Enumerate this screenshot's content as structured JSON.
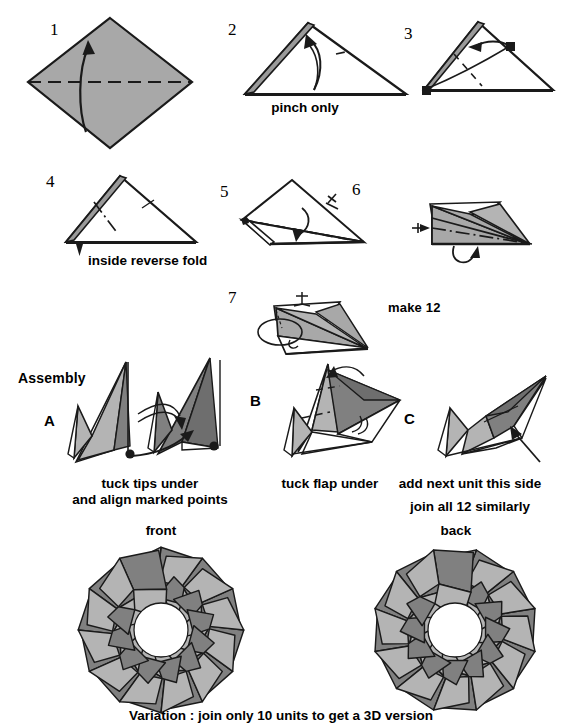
{
  "document": {
    "kind": "origami-folding-diagram",
    "title_caption": "Variation : join only 10 units to get a 3D version"
  },
  "colors": {
    "paper_light": "#b4b4b4",
    "paper_mid": "#a8a8a8",
    "paper_dark": "#808080",
    "paper_white": "#ffffff",
    "ink": "#1a1a1a"
  },
  "steps": [
    {
      "number": "1",
      "caption": ""
    },
    {
      "number": "2",
      "caption": "pinch only"
    },
    {
      "number": "3",
      "caption": ""
    },
    {
      "number": "4",
      "caption": "inside reverse fold"
    },
    {
      "number": "5",
      "caption": ""
    },
    {
      "number": "6",
      "caption": ""
    },
    {
      "number": "7",
      "caption": ""
    }
  ],
  "notes": {
    "make_units": "make 12",
    "assembly_heading": "Assembly"
  },
  "assembly": [
    {
      "letter": "A",
      "caption_line1": "tuck tips under",
      "caption_line2": "and align marked points"
    },
    {
      "letter": "B",
      "caption_line1": "tuck flap under",
      "caption_line2": ""
    },
    {
      "letter": "C",
      "caption_line1": "add next unit this side",
      "caption_line2": "join all 12 similarly"
    }
  ],
  "results": [
    {
      "label": "front",
      "units": 12
    },
    {
      "label": "back",
      "units": 12
    }
  ]
}
